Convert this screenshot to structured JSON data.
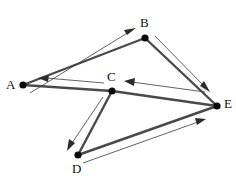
{
  "diagram": {
    "type": "directed-graph",
    "width": 236,
    "height": 184,
    "background_color": "#ffffff",
    "edge_color": "#4a4a4a",
    "arrow_color": "#2b2b2b",
    "vertex_color": "#0a0a0a",
    "label_color": "#111111",
    "vertices": [
      {
        "id": "A",
        "label": "A",
        "x": 23,
        "y": 85,
        "label_x": 6,
        "label_y": 78
      },
      {
        "id": "B",
        "label": "B",
        "x": 145,
        "y": 38,
        "label_x": 140,
        "label_y": 16
      },
      {
        "id": "C",
        "label": "C",
        "x": 112,
        "y": 91,
        "label_x": 107,
        "label_y": 70
      },
      {
        "id": "D",
        "label": "D",
        "x": 78,
        "y": 155,
        "label_x": 72,
        "label_y": 162
      },
      {
        "id": "E",
        "label": "E",
        "x": 217,
        "y": 106,
        "label_x": 224,
        "label_y": 97
      }
    ],
    "edges": [
      {
        "from": "A",
        "to": "B",
        "label": "A to B",
        "direction": "A->B"
      },
      {
        "from": "B",
        "to": "E",
        "label": "B to E",
        "direction": "B->E"
      },
      {
        "from": "E",
        "to": "C",
        "label": "E to C",
        "direction": "E->C"
      },
      {
        "from": "C",
        "to": "A",
        "label": "C to A",
        "direction": "C->A"
      },
      {
        "from": "C",
        "to": "D",
        "label": "C to D",
        "direction": "C->D"
      },
      {
        "from": "D",
        "to": "E",
        "label": "D to E",
        "direction": "D->E"
      }
    ]
  }
}
